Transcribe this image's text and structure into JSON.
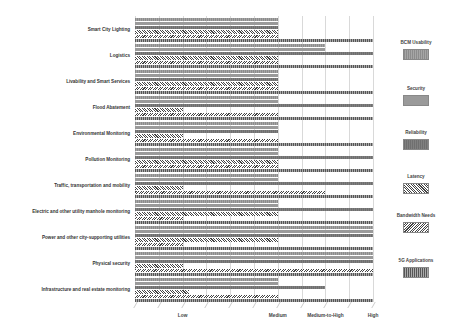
{
  "chart_data": {
    "type": "bar",
    "orientation": "horizontal",
    "title": "",
    "xlabel": "",
    "ylabel": "",
    "xlim": [
      0,
      10
    ],
    "grid": true,
    "legend_position": "right",
    "x_tick_labels": [
      {
        "label": "Low",
        "value": 2
      },
      {
        "label": "Medium",
        "value": 6
      },
      {
        "label": "Medium-to-High",
        "value": 8
      },
      {
        "label": "High",
        "value": 10
      }
    ],
    "categories": [
      "Smart City Lighting",
      "Logistics",
      "Livability and Smart Services",
      "Flood Abatement",
      "Environmental Monitoring",
      "Pollution Monitoring",
      "Traffic, transportation and mobility",
      "Electric and other utility manhole monitoring",
      "Power and other city-supporting utilities",
      "Physical security",
      "Infrastructure and real estate monitoring"
    ],
    "series": [
      {
        "name": "BCM Usability",
        "values": [
          6,
          8,
          6,
          6,
          6,
          6,
          6,
          6,
          10,
          10,
          6
        ]
      },
      {
        "name": "Security",
        "values": [
          6,
          8,
          6,
          6,
          6,
          6,
          6,
          6,
          10,
          10,
          6
        ]
      },
      {
        "name": "Reliability",
        "values": [
          6,
          10,
          6,
          10,
          6,
          10,
          10,
          10,
          10,
          10,
          8
        ]
      },
      {
        "name": "Latency",
        "values": [
          6,
          6,
          6,
          2,
          2,
          6,
          2,
          6,
          6,
          2,
          2.25
        ]
      },
      {
        "name": "Bandwidth Needs",
        "values": [
          6,
          6,
          6,
          6,
          6,
          6,
          8,
          2,
          2,
          10,
          6
        ]
      },
      {
        "name": "5G Applications",
        "values": [
          10,
          10,
          10,
          10,
          10,
          10,
          10,
          10,
          10,
          10,
          10
        ]
      }
    ]
  },
  "legend": [
    {
      "label": "BCM Usability"
    },
    {
      "label": "Security"
    },
    {
      "label": "Reliability"
    },
    {
      "label": "Latency"
    },
    {
      "label": "Bandwidth Needs"
    },
    {
      "label": "5G Applications"
    }
  ]
}
